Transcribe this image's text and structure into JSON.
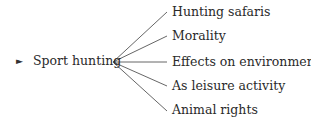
{
  "root": {
    "marker": "►",
    "label": "Sport hunting"
  },
  "branches": [
    {
      "label": "Hunting safaris"
    },
    {
      "label": "Morality"
    },
    {
      "label": "Effects on environment"
    },
    {
      "label": "As leisure activity"
    },
    {
      "label": "Animal rights"
    }
  ]
}
